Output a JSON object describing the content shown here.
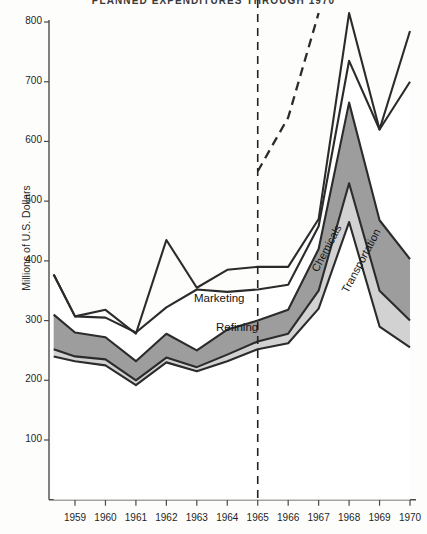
{
  "chart": {
    "title": "PLANNED EXPENDITURES THROUGH 1970",
    "ylabel": "Millions of U.S. Dollars",
    "marketing_label": "Marketing",
    "refining_label": "Refining",
    "chemicals_label": "Chemicals",
    "transportation_label": "Transportation"
  },
  "colors": {
    "band_dark": "#9d9d9d",
    "band_light": "#d2d2d2",
    "band_white": "#ffffff",
    "line": "#2b2b2b",
    "axis": "#4a4a4a",
    "background": "#fdfdfb"
  },
  "chart_data": {
    "type": "area",
    "title": "PLANNED EXPENDITURES THROUGH 1970",
    "xlabel": "",
    "ylabel": "Millions of U.S. Dollars",
    "ylim": [
      0,
      800
    ],
    "xlim": [
      1958.3,
      1970
    ],
    "grid": false,
    "legend": "inline-annotations",
    "stacked": true,
    "forecast_divider_x": 1965,
    "forecast_divider_style": "dashed-vertical",
    "x": [
      1958.3,
      1959,
      1960,
      1961,
      1962,
      1963,
      1964,
      1965,
      1966,
      1967,
      1968,
      1969,
      1970
    ],
    "yticks": [
      100,
      200,
      300,
      400,
      500,
      600,
      700,
      800
    ],
    "xticks": [
      1959,
      1960,
      1961,
      1962,
      1963,
      1964,
      1965,
      1966,
      1967,
      1968,
      1969,
      1970
    ],
    "series": [
      {
        "name": "Transportation",
        "fill": "white",
        "cumulative_top": [
          240,
          232,
          225,
          192,
          230,
          215,
          232,
          252,
          262,
          320,
          465,
          290,
          255
        ]
      },
      {
        "name": "Chemicals",
        "fill": "light-gray",
        "cumulative_top": [
          252,
          240,
          235,
          200,
          238,
          222,
          243,
          265,
          278,
          350,
          530,
          350,
          300
        ]
      },
      {
        "name": "Refining",
        "fill": "dark-gray",
        "cumulative_top": [
          310,
          280,
          272,
          232,
          278,
          250,
          285,
          300,
          318,
          420,
          665,
          468,
          403
        ]
      },
      {
        "name": "Marketing",
        "fill": "white",
        "cumulative_top": [
          377,
          307,
          305,
          280,
          322,
          352,
          348,
          352,
          360,
          458,
          735,
          620,
          700
        ]
      },
      {
        "name": "Total (actual)",
        "style": "solid-line",
        "values": [
          377,
          307,
          318,
          278,
          435,
          355,
          385,
          390,
          390,
          470,
          815,
          620,
          785
        ]
      },
      {
        "name": "Total (planned)",
        "style": "dashed-line",
        "x": [
          1965,
          1966,
          1967
        ],
        "values": [
          550,
          640,
          815
        ]
      }
    ],
    "annotations": [
      {
        "text": "Marketing",
        "x": 1962.4,
        "y": 330
      },
      {
        "text": "Refining",
        "x": 1963.2,
        "y": 283
      },
      {
        "text": "Chemicals",
        "x": 1967.0,
        "y": 455,
        "rotation": -62
      },
      {
        "text": "Transportation",
        "x": 1967.6,
        "y": 430,
        "rotation": -62
      }
    ]
  }
}
